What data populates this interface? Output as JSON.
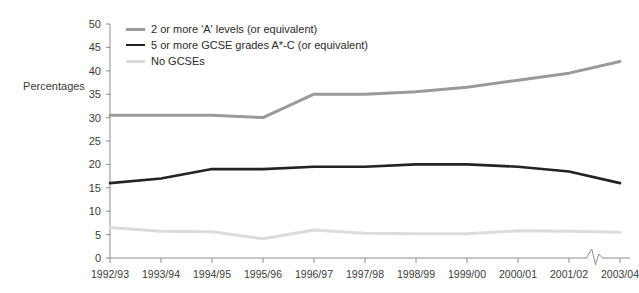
{
  "chart_data": {
    "type": "line",
    "title": "",
    "xlabel": "",
    "ylabel": "Percentages",
    "ylim": [
      0,
      50
    ],
    "ytick_step": 5,
    "yticks": [
      0,
      5,
      10,
      15,
      20,
      25,
      30,
      35,
      40,
      45,
      50
    ],
    "grid": false,
    "legend_position": "top-left inside plot",
    "categories": [
      "1992/93",
      "1993/94",
      "1994/95",
      "1995/96",
      "1996/97",
      "1997/98",
      "1998/99",
      "1999/00",
      "2000/01",
      "2001/02",
      "2003/04"
    ],
    "axis_break": {
      "symbol": "zigzag",
      "between": [
        "2001/02",
        "2003/04"
      ],
      "note": "2002/03 omitted from the x-axis"
    },
    "series": [
      {
        "name": "2 or more 'A' levels (or equivalent)",
        "color": "#9a9a9a",
        "width": 3,
        "values": [
          30.5,
          30.5,
          30.5,
          30,
          35,
          35,
          35.5,
          36.5,
          38,
          39.5,
          42
        ]
      },
      {
        "name": "5 or more GCSE grades A*-C (or equivalent)",
        "color": "#232323",
        "width": 2.6,
        "values": [
          16,
          17,
          19,
          19,
          19.5,
          19.5,
          20,
          20,
          19.5,
          18.5,
          16
        ]
      },
      {
        "name": "No GCSEs",
        "color": "#dcdcdc",
        "width": 3,
        "values": [
          6.5,
          5.7,
          5.6,
          4.1,
          6,
          5.3,
          5.2,
          5.2,
          5.8,
          5.7,
          5.5
        ]
      }
    ]
  },
  "axes": {
    "spine_color": "#8c8c8c",
    "tick_color": "#8c8c8c",
    "label_color": "#3b3b3b"
  },
  "background": "#ffffff"
}
